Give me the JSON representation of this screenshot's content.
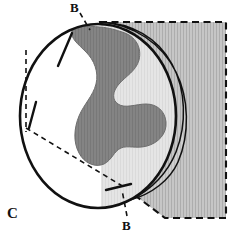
{
  "figure": {
    "panel_letter": "C",
    "caption_labels": {
      "panel": "C",
      "landmark_top": "B",
      "landmark_bottom": "B"
    },
    "colors": {
      "background": "#ffffff",
      "outline": "#111111",
      "hatch_fill": "#c0c0c0",
      "hatch_line": "#ababab",
      "lesion_fill": "#808080",
      "lesion_line": "#747474",
      "crescent_fill": "#c8c8c8",
      "sphere_fill": "#ffffff",
      "dashed_line": "#111111"
    },
    "geometry": {
      "sphere_center_x": 98,
      "sphere_center_y": 116,
      "sphere_radius_x": 78,
      "sphere_radius_y": 92,
      "hatched_region": "polygon top-left (100,22) to right (226,22) to (226,218) to (165,218) to (124,187)",
      "dashed_rect_top_y": 22,
      "dashed_rect_right_x": 226,
      "dashed_rect_bottom_y": 218
    }
  },
  "elements": {
    "sphere_label": "femoral head sphere outline",
    "lesion_label": "dark shaded lesion area",
    "crescent_label": "light crescent rim band",
    "hatched_label": "hatched resection region",
    "tick_top_label": "upper osteotomy tick mark",
    "tick_left_label": "lower osteotomy tick mark",
    "tick_bottom_label": "bottom osteotomy tick mark",
    "dashed_vertical_label": "vertical construction line",
    "dashed_diagonal_label": "diagonal construction line",
    "leader_top_label": "leader line to upper B",
    "leader_bottom_label": "leader line to lower B"
  }
}
